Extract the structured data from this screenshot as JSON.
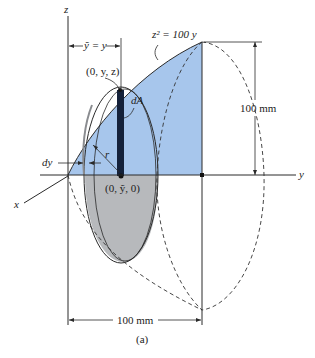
{
  "figure": {
    "caption": "(a)",
    "axes": {
      "z": "z",
      "y": "y",
      "x": "x"
    },
    "curve_label": "z² = 100 y",
    "labels": {
      "ybar_eq": "ỹ = y",
      "point_top": "(0, y, z)",
      "point_center": "(0, ỹ, 0)",
      "dA": "dA",
      "r": "r",
      "dy": "dy"
    },
    "dimensions": {
      "height": "100 mm",
      "width": "100 mm"
    },
    "colors": {
      "region_fill": "#a7c6ec",
      "disc_lower_fill": "#b7b9bc",
      "strip_fill": "#14213a",
      "line": "#2a2a2a"
    }
  }
}
